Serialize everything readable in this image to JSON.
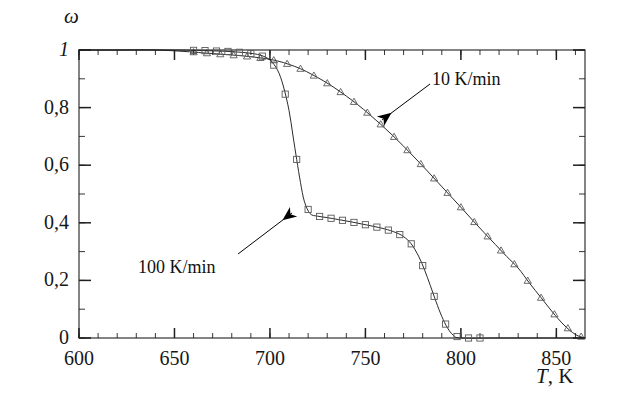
{
  "figure": {
    "name": "conversion-vs-temperature-plot",
    "background": "#ffffff",
    "ink_color": "#1f1f1f",
    "marker_color": "#5a5a5a"
  },
  "axes": {
    "y": {
      "symbol": "ω",
      "min": 0,
      "max": 1,
      "major_ticks": [
        0,
        0.2,
        0.4,
        0.6,
        0.8,
        1
      ],
      "tick_labels": [
        "0",
        "0,2",
        "0,4",
        "0,6",
        "0,8",
        "1"
      ],
      "minor_per_major": 2
    },
    "x": {
      "symbol": "T",
      "unit": "K",
      "label": ", K",
      "min": 600,
      "max": 865,
      "major_ticks": [
        600,
        650,
        700,
        750,
        800,
        850
      ],
      "tick_labels": [
        "600",
        "650",
        "700",
        "750",
        "800",
        "850"
      ],
      "minor_step": 10
    }
  },
  "annotations": [
    {
      "id": "note-10",
      "label": "10 K/min",
      "arrow_from": [
        430,
        84
      ],
      "arrow_to": [
        382,
        120
      ]
    },
    {
      "id": "note-100",
      "label": "100 K/min",
      "arrow_from": [
        238,
        254
      ],
      "arrow_to": [
        292,
        213
      ]
    }
  ],
  "chart_data": {
    "type": "line",
    "title": "",
    "xlabel": "T, K",
    "ylabel": "ω",
    "xlim": [
      600,
      865
    ],
    "ylim": [
      0,
      1
    ],
    "grid": false,
    "legend": "annotated-arrows",
    "series": [
      {
        "name": "10 K/min",
        "marker": "triangle",
        "style": "fitted curve with open triangle data points",
        "x": [
          600,
          620,
          640,
          655,
          665,
          675,
          685,
          692,
          698,
          704,
          710,
          716,
          722,
          728,
          734,
          740,
          746,
          752,
          758,
          764,
          770,
          776,
          782,
          788,
          794,
          800,
          806,
          812,
          818,
          824,
          830,
          836,
          842,
          848,
          854,
          860,
          865
        ],
        "y": [
          1.0,
          1.0,
          1.0,
          0.995,
          0.99,
          0.985,
          0.98,
          0.975,
          0.97,
          0.962,
          0.95,
          0.935,
          0.915,
          0.893,
          0.868,
          0.84,
          0.81,
          0.777,
          0.742,
          0.705,
          0.666,
          0.625,
          0.583,
          0.54,
          0.497,
          0.454,
          0.41,
          0.367,
          0.325,
          0.283,
          0.243,
          0.19,
          0.14,
          0.09,
          0.045,
          0.012,
          0.0
        ]
      },
      {
        "name": "100 K/min",
        "marker": "square",
        "style": "fitted curve with open square data points",
        "x": [
          600,
          625,
          650,
          665,
          678,
          688,
          695,
          700,
          704,
          707,
          710,
          712,
          714,
          716,
          718,
          721,
          725,
          730,
          736,
          742,
          748,
          754,
          760,
          766,
          770,
          774,
          778,
          781,
          784,
          787,
          790,
          793,
          796,
          800,
          820,
          840,
          865
        ],
        "y": [
          1.0,
          1.0,
          1.0,
          0.998,
          0.995,
          0.99,
          0.982,
          0.965,
          0.93,
          0.875,
          0.79,
          0.705,
          0.62,
          0.54,
          0.475,
          0.432,
          0.423,
          0.418,
          0.411,
          0.404,
          0.396,
          0.388,
          0.379,
          0.366,
          0.352,
          0.327,
          0.282,
          0.236,
          0.182,
          0.126,
          0.075,
          0.035,
          0.01,
          0.0,
          0.0,
          0.0,
          0.0
        ]
      }
    ]
  }
}
